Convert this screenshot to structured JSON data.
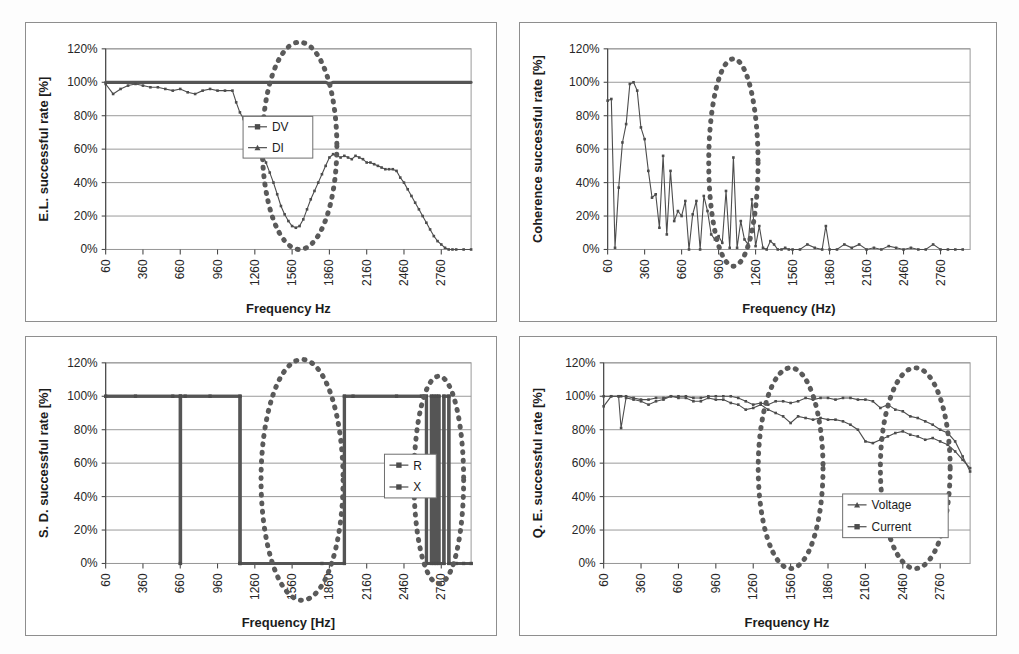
{
  "figure": {
    "panel_count": 4,
    "background": "#ffffff",
    "series_color": "#4c4c4c",
    "annotation_color": "#5a5a5a",
    "grid_color": "#9a9a9a"
  },
  "chart_data": [
    {
      "id": "el-success-rate",
      "position": "top-left",
      "type": "line",
      "title": "",
      "ylabel": "E.L. successful rate [%]",
      "xlabel": "Frequency Hz",
      "ylim": [
        0,
        120
      ],
      "yticks": [
        "0%",
        "20%",
        "40%",
        "60%",
        "80%",
        "100%",
        "120%"
      ],
      "ytick_values": [
        0,
        20,
        40,
        60,
        80,
        100,
        120
      ],
      "xlim": [
        60,
        3000
      ],
      "xticks": [
        "60",
        "360",
        "660",
        "960",
        "1260",
        "1560",
        "1860",
        "2160",
        "2460",
        "2760"
      ],
      "xtick_values": [
        60,
        360,
        660,
        960,
        1260,
        1560,
        1860,
        2160,
        2460,
        2760
      ],
      "grid": true,
      "legend": {
        "position": "right-upper",
        "entries": [
          {
            "name": "DV",
            "marker": "square"
          },
          {
            "name": "DI",
            "marker": "triangle"
          }
        ]
      },
      "annotations": [
        {
          "shape": "dotted-ellipse",
          "cx": 1620,
          "cy": 62,
          "rx": 300,
          "ry": 62
        }
      ],
      "x": [
        60,
        120,
        180,
        240,
        300,
        360,
        420,
        480,
        540,
        600,
        660,
        720,
        780,
        840,
        900,
        960,
        1020,
        1080,
        1110,
        1140,
        1170,
        1200,
        1230,
        1260,
        1290,
        1320,
        1350,
        1380,
        1410,
        1440,
        1470,
        1500,
        1530,
        1560,
        1590,
        1620,
        1650,
        1680,
        1710,
        1740,
        1770,
        1800,
        1830,
        1860,
        1890,
        1920,
        1950,
        1980,
        2010,
        2040,
        2070,
        2100,
        2130,
        2160,
        2190,
        2220,
        2250,
        2280,
        2310,
        2340,
        2370,
        2400,
        2430,
        2460,
        2490,
        2520,
        2550,
        2580,
        2610,
        2640,
        2670,
        2700,
        2730,
        2760,
        2790,
        2820,
        2850,
        2880,
        2940,
        3000
      ],
      "series": [
        {
          "name": "DV",
          "style": "thick-flat",
          "values": [
            100,
            100,
            100,
            100,
            100,
            100,
            100,
            100,
            100,
            100,
            100,
            100,
            100,
            100,
            100,
            100,
            100,
            100,
            100,
            100,
            100,
            100,
            100,
            100,
            100,
            100,
            100,
            100,
            100,
            100,
            100,
            100,
            100,
            100,
            100,
            100,
            100,
            100,
            100,
            100,
            100,
            100,
            100,
            99,
            100,
            100,
            100,
            100,
            100,
            100,
            100,
            100,
            100,
            100,
            100,
            100,
            100,
            100,
            100,
            100,
            100,
            100,
            100,
            100,
            100,
            100,
            100,
            100,
            100,
            100,
            100,
            100,
            100,
            100,
            100,
            100,
            100,
            100,
            100,
            100
          ]
        },
        {
          "name": "DI",
          "style": "marker-line",
          "values": [
            99,
            93,
            96,
            98,
            99,
            98,
            97,
            97,
            96,
            95,
            96,
            94,
            93,
            95,
            96,
            95,
            95,
            95,
            88,
            82,
            78,
            72,
            68,
            65,
            62,
            57,
            52,
            46,
            40,
            33,
            26,
            21,
            17,
            14,
            13,
            14,
            18,
            24,
            30,
            35,
            40,
            45,
            50,
            55,
            57,
            56,
            55,
            56,
            55,
            54,
            56,
            55,
            54,
            52,
            52,
            51,
            50,
            49,
            48,
            48,
            48,
            47,
            43,
            40,
            36,
            32,
            28,
            24,
            20,
            16,
            12,
            8,
            5,
            3,
            1,
            0,
            0,
            0,
            0,
            0
          ]
        }
      ]
    },
    {
      "id": "coherence-success-rate",
      "position": "top-right",
      "type": "line",
      "title": "",
      "ylabel": "Coherence successful rate [%]",
      "xlabel": "Frequency (Hz)",
      "ylim": [
        0,
        120
      ],
      "yticks": [
        "0%",
        "20%",
        "40%",
        "60%",
        "80%",
        "100%",
        "120%"
      ],
      "ytick_values": [
        0,
        20,
        40,
        60,
        80,
        100,
        120
      ],
      "xlim": [
        60,
        3000
      ],
      "xticks": [
        "60",
        "360",
        "660",
        "960",
        "1260",
        "1560",
        "1860",
        "2160",
        "2460",
        "2760"
      ],
      "xtick_values": [
        60,
        360,
        660,
        960,
        1260,
        1560,
        1860,
        2160,
        2460,
        2760
      ],
      "grid": true,
      "legend": null,
      "annotations": [
        {
          "shape": "dotted-ellipse",
          "cx": 1080,
          "cy": 52,
          "rx": 200,
          "ry": 62
        }
      ],
      "x": [
        60,
        90,
        120,
        150,
        180,
        210,
        240,
        270,
        300,
        330,
        360,
        390,
        420,
        450,
        480,
        510,
        540,
        570,
        600,
        630,
        660,
        690,
        720,
        750,
        780,
        810,
        840,
        870,
        900,
        930,
        960,
        990,
        1020,
        1050,
        1080,
        1110,
        1140,
        1170,
        1200,
        1230,
        1260,
        1290,
        1320,
        1350,
        1380,
        1410,
        1440,
        1470,
        1500,
        1530,
        1560,
        1620,
        1680,
        1740,
        1800,
        1830,
        1860,
        1920,
        1980,
        2040,
        2100,
        2160,
        2220,
        2280,
        2340,
        2400,
        2460,
        2520,
        2580,
        2640,
        2700,
        2760,
        2820,
        2880,
        2940
      ],
      "series": [
        {
          "name": "Coherence",
          "style": "marker-line",
          "values": [
            89,
            90,
            1,
            37,
            64,
            75,
            99,
            100,
            95,
            73,
            66,
            47,
            31,
            33,
            13,
            56,
            9,
            47,
            17,
            23,
            20,
            29,
            0,
            21,
            29,
            0,
            32,
            23,
            9,
            6,
            8,
            4,
            35,
            1,
            55,
            1,
            17,
            6,
            3,
            30,
            2,
            14,
            1,
            0,
            5,
            3,
            0,
            0,
            1,
            0,
            0,
            0,
            3,
            1,
            0,
            14,
            0,
            0,
            3,
            1,
            3,
            0,
            1,
            0,
            2,
            1,
            0,
            1,
            0,
            0,
            3,
            0,
            0,
            0,
            0
          ]
        }
      ]
    },
    {
      "id": "sd-success-rate",
      "position": "bottom-left",
      "type": "line",
      "title": "",
      "ylabel": "S. D. successful rate [%]",
      "xlabel": "Frequency [Hz]",
      "ylim": [
        0,
        120
      ],
      "yticks": [
        "0%",
        "20%",
        "40%",
        "60%",
        "80%",
        "100%",
        "120%"
      ],
      "ytick_values": [
        0,
        20,
        40,
        60,
        80,
        100,
        120
      ],
      "xlim": [
        60,
        3000
      ],
      "xticks": [
        "60",
        "360",
        "660",
        "960",
        "1260",
        "1560",
        "1860",
        "2160",
        "2460",
        "2760"
      ],
      "xtick_values": [
        60,
        360,
        660,
        960,
        1260,
        1560,
        1860,
        2160,
        2460,
        2760
      ],
      "grid": true,
      "legend": {
        "position": "middle-right",
        "entries": [
          {
            "name": "R",
            "marker": "square"
          },
          {
            "name": "X",
            "marker": "square"
          }
        ]
      },
      "annotations": [
        {
          "shape": "dotted-ellipse",
          "cx": 1640,
          "cy": 50,
          "rx": 330,
          "ry": 72
        },
        {
          "shape": "dotted-ellipse",
          "cx": 2740,
          "cy": 50,
          "rx": 200,
          "ry": 62
        }
      ],
      "x": [
        60,
        300,
        600,
        660,
        661,
        662,
        700,
        900,
        1140,
        1141,
        1142,
        1800,
        1980,
        1981,
        2050,
        2400,
        2600,
        2640,
        2641,
        2680,
        2681,
        2700,
        2701,
        2720,
        2721,
        2740,
        2741,
        2780,
        2781,
        2820,
        2821,
        2880,
        2940,
        3000
      ],
      "series": [
        {
          "name": "R",
          "style": "step",
          "values": [
            100,
            100,
            100,
            100,
            0,
            100,
            100,
            100,
            100,
            0,
            0,
            0,
            0,
            100,
            100,
            100,
            100,
            100,
            0,
            0,
            100,
            100,
            0,
            0,
            100,
            100,
            0,
            0,
            100,
            100,
            0,
            0,
            0,
            0
          ]
        },
        {
          "name": "X",
          "style": "step",
          "values": [
            100,
            100,
            100,
            100,
            0,
            100,
            100,
            100,
            100,
            0,
            0,
            0,
            0,
            100,
            100,
            100,
            100,
            100,
            0,
            0,
            100,
            100,
            0,
            0,
            100,
            100,
            0,
            0,
            100,
            100,
            0,
            0,
            0,
            0
          ]
        }
      ]
    },
    {
      "id": "qe-success-rate",
      "position": "bottom-right",
      "type": "line",
      "title": "",
      "ylabel": "Q. E. successful rate [%]",
      "xlabel": "Frequency Hz",
      "ylim": [
        0,
        120
      ],
      "yticks": [
        "0%",
        "20%",
        "40%",
        "60%",
        "80%",
        "100%",
        "120%"
      ],
      "ytick_values": [
        0,
        20,
        40,
        60,
        80,
        100,
        120
      ],
      "xlim": [
        60,
        3000
      ],
      "xticks": [
        "60",
        "360",
        "660",
        "960",
        "1260",
        "1560",
        "1860",
        "2160",
        "2460",
        "2760"
      ],
      "xtick_values": [
        60,
        360,
        660,
        960,
        1260,
        1560,
        1860,
        2160,
        2460,
        2760
      ],
      "grid": true,
      "legend": {
        "position": "lower-right",
        "entries": [
          {
            "name": "Voltage",
            "marker": "triangle"
          },
          {
            "name": "Current",
            "marker": "square"
          }
        ]
      },
      "annotations": [
        {
          "shape": "dotted-ellipse",
          "cx": 1560,
          "cy": 57,
          "rx": 260,
          "ry": 60
        },
        {
          "shape": "dotted-ellipse",
          "cx": 2560,
          "cy": 57,
          "rx": 280,
          "ry": 60
        }
      ],
      "x": [
        60,
        120,
        180,
        200,
        240,
        300,
        360,
        420,
        480,
        540,
        600,
        660,
        720,
        780,
        840,
        900,
        960,
        1020,
        1080,
        1140,
        1200,
        1260,
        1320,
        1380,
        1440,
        1500,
        1560,
        1620,
        1680,
        1740,
        1800,
        1860,
        1920,
        1980,
        2040,
        2100,
        2160,
        2220,
        2280,
        2340,
        2400,
        2460,
        2520,
        2580,
        2640,
        2700,
        2760,
        2820,
        2880,
        2940,
        3000
      ],
      "series": [
        {
          "name": "Voltage",
          "style": "marker-line",
          "values": [
            94,
            100,
            100,
            81,
            99,
            98,
            97,
            95,
            97,
            98,
            100,
            99,
            99,
            97,
            97,
            99,
            98,
            98,
            96,
            95,
            92,
            93,
            95,
            92,
            90,
            88,
            84,
            88,
            87,
            86,
            87,
            86,
            86,
            85,
            83,
            80,
            73,
            72,
            74,
            76,
            78,
            79,
            77,
            76,
            74,
            75,
            73,
            71,
            67,
            62,
            57
          ]
        },
        {
          "name": "Current",
          "style": "marker-line",
          "values": [
            100,
            100,
            100,
            100,
            100,
            99,
            98,
            98,
            99,
            99,
            100,
            100,
            100,
            99,
            99,
            100,
            100,
            100,
            100,
            99,
            97,
            95,
            96,
            95,
            97,
            97,
            96,
            97,
            99,
            98,
            99,
            99,
            98,
            99,
            99,
            98,
            98,
            97,
            93,
            95,
            92,
            91,
            88,
            87,
            85,
            83,
            80,
            78,
            73,
            64,
            55
          ]
        }
      ]
    }
  ]
}
